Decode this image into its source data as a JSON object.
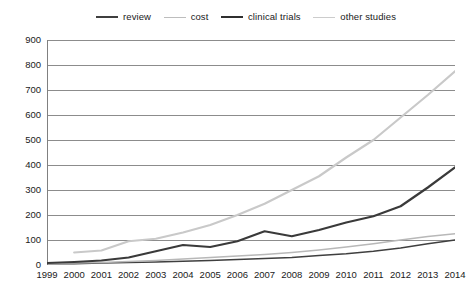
{
  "chart_data": {
    "type": "line",
    "title": "",
    "xlabel": "",
    "ylabel": "",
    "categories": [
      1999,
      2000,
      2001,
      2002,
      2003,
      2004,
      2005,
      2006,
      2007,
      2008,
      2009,
      2010,
      2011,
      2012,
      2013,
      2014
    ],
    "x": [
      "1999",
      "2000",
      "2001",
      "2002",
      "2003",
      "2004",
      "2005",
      "2006",
      "2007",
      "2008",
      "2009",
      "2010",
      "2011",
      "2012",
      "2013",
      "2014"
    ],
    "ylim": [
      0,
      900
    ],
    "ytick_values": [
      0,
      100,
      200,
      300,
      400,
      500,
      600,
      700,
      800,
      900
    ],
    "ytick_labels": [
      "0",
      "100",
      "200",
      "300",
      "400",
      "500",
      "600",
      "700",
      "800",
      "900"
    ],
    "ystep": 100,
    "grid": true,
    "grid_axis": "y",
    "legend_position": "top",
    "series": [
      {
        "name": "review",
        "color": "#3f3f3f",
        "width": 1.6,
        "values": [
          5,
          5,
          8,
          10,
          12,
          15,
          18,
          22,
          26,
          30,
          38,
          45,
          55,
          68,
          85,
          100
        ]
      },
      {
        "name": "cost",
        "color": "#b8b8b8",
        "width": 1.6,
        "values": [
          6,
          8,
          10,
          14,
          18,
          24,
          30,
          36,
          42,
          50,
          60,
          72,
          85,
          100,
          114,
          125
        ]
      },
      {
        "name": "clinical trials",
        "color": "#3a3a3a",
        "width": 2.2,
        "values": [
          8,
          12,
          18,
          30,
          55,
          80,
          72,
          95,
          135,
          115,
          140,
          170,
          195,
          235,
          310,
          390
        ]
      },
      {
        "name": "other studies",
        "color": "#c9c9c9",
        "width": 2.2,
        "values": [
          null,
          50,
          58,
          95,
          105,
          130,
          160,
          200,
          245,
          300,
          355,
          430,
          500,
          590,
          680,
          775
        ]
      }
    ]
  },
  "legend": {
    "items": [
      {
        "label": "review",
        "color": "#3f3f3f",
        "width": 2.2
      },
      {
        "label": "cost",
        "color": "#bdbdbd",
        "width": 1.6
      },
      {
        "label": "clinical trials",
        "color": "#2f2f2f",
        "width": 2.6
      },
      {
        "label": "other studies",
        "color": "#cccccc",
        "width": 1.8
      }
    ]
  },
  "axes": {
    "axis_color": "#808080",
    "grid_color": "#6e6e6e",
    "tick_color": "#808080"
  }
}
